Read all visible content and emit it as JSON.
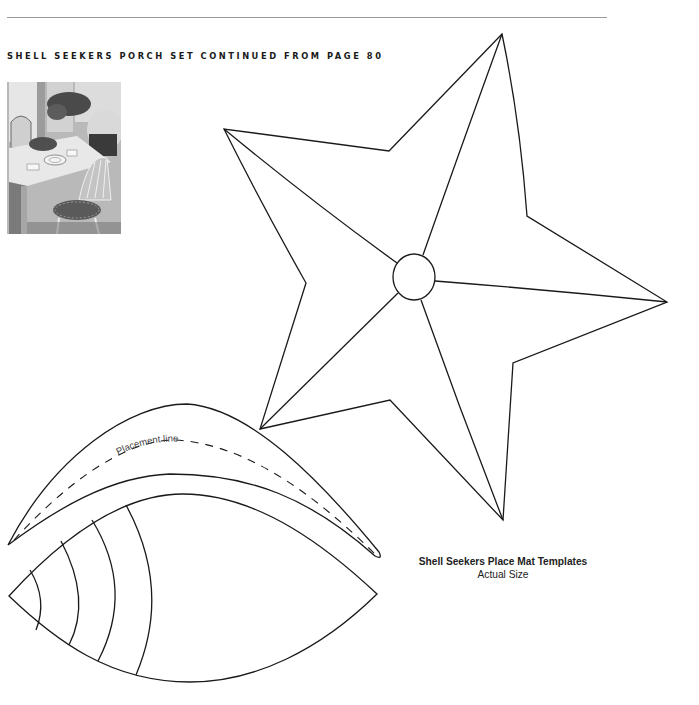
{
  "page": {
    "heading": "SHELL SEEKERS PORCH SET CONTINUED FROM PAGE 80",
    "photo": {
      "description": "Porch table with place mats, dishes, plant centerpiece and cushioned Windsor chairs",
      "style": "black-and-white"
    }
  },
  "templates": {
    "star": {
      "name": "star-template",
      "outline_points": [
        [
          502,
          34
        ],
        [
          389,
          151
        ],
        [
          224,
          129
        ],
        [
          306,
          283
        ],
        [
          260,
          429
        ],
        [
          390,
          400
        ],
        [
          503,
          520
        ],
        [
          513,
          363
        ],
        [
          667,
          302
        ],
        [
          527,
          216
        ]
      ],
      "center_circle": {
        "cx": 414,
        "cy": 277,
        "rx": 21,
        "ry": 23
      }
    },
    "crescent": {
      "name": "crescent-template",
      "placement_label": "Placement line"
    },
    "shell": {
      "name": "shell-template",
      "arc_count": 4
    }
  },
  "caption": {
    "title": "Shell Seekers Place Mat Templates",
    "subtitle": "Actual Size"
  },
  "colors": {
    "line": "#1a1a1a",
    "rule": "#9a9a9a",
    "background": "#ffffff"
  }
}
